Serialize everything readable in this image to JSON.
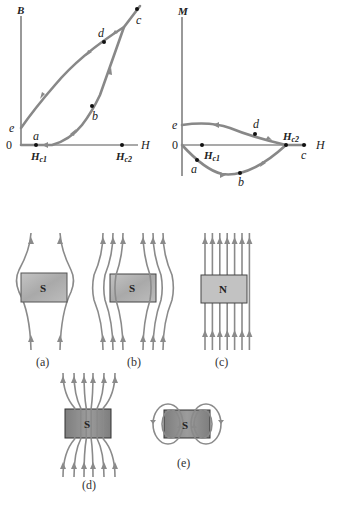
{
  "graph_b": {
    "y_axis_label": "B",
    "x_axis_label": "H",
    "origin_label": "0",
    "points": {
      "a": "a",
      "b": "b",
      "c": "c",
      "d": "d",
      "e": "e"
    },
    "hc1_label": "H",
    "hc1_sub": "c1",
    "hc2_label": "H",
    "hc2_sub": "c2"
  },
  "graph_m": {
    "y_axis_label": "M",
    "x_axis_label": "H",
    "origin_label": "0",
    "points": {
      "a": "a",
      "b": "b",
      "c": "c",
      "d": "d",
      "e": "e"
    },
    "hc1_label": "H",
    "hc1_sub": "c1",
    "hc2_label": "H",
    "hc2_sub": "c2"
  },
  "panels": [
    {
      "caption": "(a)",
      "label": "S"
    },
    {
      "caption": "(b)",
      "label": "S"
    },
    {
      "caption": "(c)",
      "label": "N"
    },
    {
      "caption": "(d)",
      "label": "S"
    },
    {
      "caption": "(e)",
      "label": "S"
    }
  ],
  "colors": {
    "curve": "#888888",
    "sample_fill": "#b5b5b5",
    "sample_fill_dark": "#8f8f8f"
  }
}
